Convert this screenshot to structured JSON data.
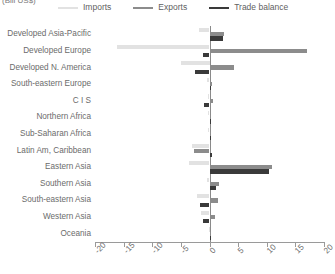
{
  "unit_caption": "(Bill US$)",
  "legend": {
    "items": [
      {
        "label": "Imports",
        "color": "#e2e2e2",
        "key": "imports"
      },
      {
        "label": "Exports",
        "color": "#8c8c8c",
        "key": "exports"
      },
      {
        "label": "Trade balance",
        "color": "#3a3a3a",
        "key": "balance"
      }
    ]
  },
  "chart_data": {
    "type": "bar",
    "orientation": "horizontal",
    "title": "",
    "subtitle": "",
    "xlabel": "(Bill US$)",
    "ylabel": "",
    "xlim": [
      -20,
      20
    ],
    "xticks": [
      -20,
      -15,
      -10,
      -5,
      0,
      5,
      10,
      15,
      20
    ],
    "xtick_labels": [
      "-20",
      "-15",
      "-10",
      "-5",
      "0",
      "5",
      "10",
      "15",
      "20"
    ],
    "grid": false,
    "legend_position": "top",
    "categories": [
      "Developed Asia-Pacific",
      "Developed Europe",
      "Developed N. America",
      "South-eastern Europe",
      "C I S",
      "Northern Africa",
      "Sub-Saharan Africa",
      "Latin Am, Caribbean",
      "Eastern Asia",
      "Southern Asia",
      "South-eastern Asia",
      "Western Asia",
      "Oceania"
    ],
    "series": [
      {
        "name": "Imports",
        "color": "#e2e2e2",
        "values": [
          -1.8,
          -16.2,
          -5.0,
          -0.4,
          -0.3,
          -0.2,
          -0.3,
          -3.1,
          -3.6,
          -0.5,
          -2.1,
          -1.4,
          -0.1
        ]
      },
      {
        "name": "Exports",
        "color": "#8c8c8c",
        "values": [
          2.6,
          17.0,
          4.2,
          0.5,
          0.6,
          0.3,
          0.2,
          -2.7,
          11.0,
          1.6,
          1.5,
          0.9,
          0.1
        ]
      },
      {
        "name": "Trade balance",
        "color": "#3a3a3a",
        "values": [
          2.3,
          -1.1,
          -2.6,
          0.3,
          -0.9,
          0.2,
          0.2,
          0.4,
          10.4,
          1.2,
          -1.6,
          -1.2,
          0.05
        ]
      }
    ]
  }
}
